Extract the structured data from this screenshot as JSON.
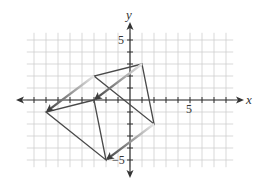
{
  "chart_data": {
    "type": "diagram-translation",
    "title": "",
    "xlabel": "x",
    "ylabel": "y",
    "xlim": [
      -9,
      9
    ],
    "ylim": [
      -6,
      6
    ],
    "grid": true,
    "tick_labels": {
      "x": [
        {
          "value": 5,
          "label": "5"
        }
      ],
      "y": [
        {
          "value": 5,
          "label": "5"
        },
        {
          "value": -5,
          "label": "−5"
        }
      ]
    },
    "preimage_triangle": {
      "vertices": [
        [
          1,
          3
        ],
        [
          -3,
          2
        ],
        [
          2,
          -2
        ]
      ]
    },
    "image_triangle": {
      "vertices": [
        [
          -3,
          0
        ],
        [
          -7,
          -1
        ],
        [
          -2,
          -5
        ]
      ]
    },
    "translation_vector": [
      -4,
      -3
    ],
    "arrows": [
      {
        "from": [
          1,
          3
        ],
        "to": [
          -3,
          0
        ]
      },
      {
        "from": [
          -3,
          2
        ],
        "to": [
          -7,
          -1
        ]
      },
      {
        "from": [
          2,
          -2
        ],
        "to": [
          -2,
          -5
        ]
      }
    ]
  },
  "labels": {
    "x_axis": "x",
    "y_axis": "y",
    "x_tick_5": "5",
    "y_tick_5": "5",
    "y_tick_neg5": "−5"
  },
  "colors": {
    "grid": "#c8c8c8",
    "axis": "#333333",
    "triangle": "#4a4a4a",
    "arrow_dark": "#4a4a4a",
    "arrow_light": "#e0e0e0"
  }
}
